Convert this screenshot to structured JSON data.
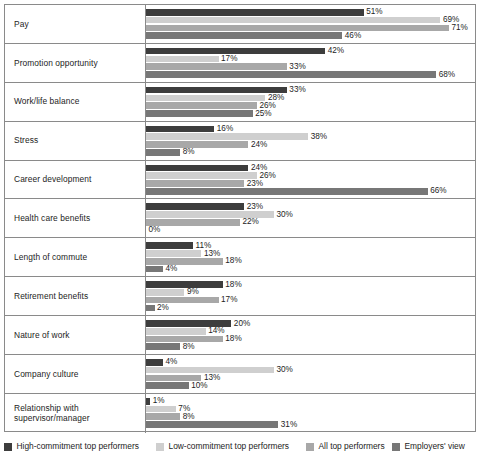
{
  "chart_data": {
    "type": "bar",
    "orientation": "horizontal",
    "title": "",
    "subtitle": "",
    "xlabel": "",
    "ylabel": "",
    "xlim": [
      0,
      71
    ],
    "grid": false,
    "legend_position": "bottom",
    "value_suffix": "%",
    "categories": [
      "Pay",
      "Promotion opportunity",
      "Work/life balance",
      "Stress",
      "Career development",
      "Health care benefits",
      "Length of commute",
      "Retirement benefits",
      "Nature of work",
      "Company culture",
      "Relationship with supervisor/manager"
    ],
    "series": [
      {
        "name": "High-commitment top performers",
        "color": "#3d3d3d",
        "values": [
          51,
          42,
          33,
          16,
          24,
          23,
          11,
          18,
          20,
          4,
          1
        ],
        "labels": [
          "51%",
          "42%",
          "33%",
          "16%",
          "24%",
          "23%",
          "11%",
          "18%",
          "20%",
          "4%",
          "1%"
        ]
      },
      {
        "name": "Low-commitment top performers",
        "color": "#cfcfcf",
        "values": [
          69,
          17,
          28,
          38,
          26,
          30,
          13,
          9,
          14,
          30,
          7
        ],
        "labels": [
          "69%",
          "17%",
          "28%",
          "38%",
          "26%",
          "30%",
          "13%",
          "9%",
          "14%",
          "30%",
          "7%"
        ]
      },
      {
        "name": "All top performers",
        "color": "#a8a8a8",
        "values": [
          71,
          33,
          26,
          24,
          23,
          22,
          18,
          17,
          18,
          13,
          8
        ],
        "labels": [
          "71%",
          "33%",
          "26%",
          "24%",
          "23%",
          "22%",
          "18%",
          "17%",
          "18%",
          "13%",
          "8%"
        ]
      },
      {
        "name": "Employers' view",
        "color": "#777777",
        "values": [
          46,
          68,
          25,
          8,
          66,
          0,
          4,
          2,
          8,
          10,
          31
        ],
        "labels": [
          "46%",
          "68%",
          "25%",
          "8%",
          "66%",
          "0%",
          "4%",
          "2%",
          "8%",
          "10%",
          "31%"
        ]
      }
    ]
  },
  "legend": {
    "items": [
      {
        "label": "High-commitment top performers",
        "color": "#3d3d3d"
      },
      {
        "label": "Low-commitment top performers",
        "color": "#cfcfcf"
      },
      {
        "label": "All top performers",
        "color": "#a8a8a8"
      },
      {
        "label": "Employers' view",
        "color": "#777777"
      }
    ]
  }
}
